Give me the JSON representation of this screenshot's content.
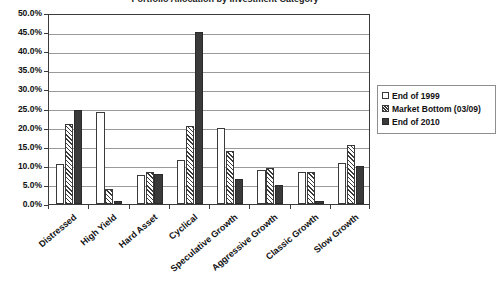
{
  "chart_data": {
    "type": "bar",
    "title": "Portfolio Allocation by Investment Category",
    "xlabel": "",
    "ylabel": "",
    "ylim": [
      0,
      50
    ],
    "ytick_step": 5,
    "grid": true,
    "legend_position": "right",
    "ytick_labels": [
      "50.0%",
      "45.0%",
      "40.0%",
      "35.0%",
      "30.0%",
      "25.0%",
      "20.0%",
      "15.0%",
      "10.0%",
      "5.0%",
      "0.0%"
    ],
    "categories": [
      "Distressed",
      "High Yield",
      "Hard Asset",
      "Cyclical",
      "Speculative Growth",
      "Aggressive Growth",
      "Classic Growth",
      "Slow Growth"
    ],
    "series": [
      {
        "name": "End of 1999",
        "style": "hollow",
        "color": "#ffffff",
        "values": [
          10.5,
          24.0,
          7.5,
          11.5,
          20.0,
          8.8,
          8.5,
          10.8
        ]
      },
      {
        "name": "Market Bottom (03/09)",
        "style": "hatched",
        "color": "#3a3a3a",
        "values": [
          21.0,
          3.8,
          8.5,
          20.5,
          13.8,
          9.5,
          8.5,
          15.5
        ]
      },
      {
        "name": "End of 2010",
        "style": "solid",
        "color": "#3a3a3a",
        "values": [
          24.5,
          0.8,
          7.8,
          45.0,
          6.5,
          5.0,
          0.8,
          10.0
        ]
      }
    ]
  }
}
